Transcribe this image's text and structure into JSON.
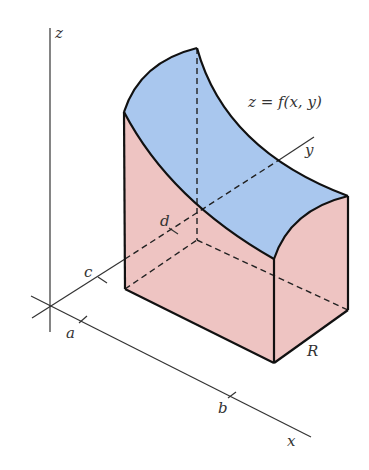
{
  "figure": {
    "surface_label": "z = f(x, y)",
    "region_label": "R",
    "axes": {
      "x": "x",
      "y": "y",
      "z": "z"
    },
    "ticks": {
      "a": "a",
      "b": "b",
      "c": "c",
      "d": "d"
    },
    "colors": {
      "top_surface": "#a9c7ee",
      "side_faces": "#eec4c2",
      "base_region": "#d9ecfa",
      "edges": "#111111"
    }
  }
}
